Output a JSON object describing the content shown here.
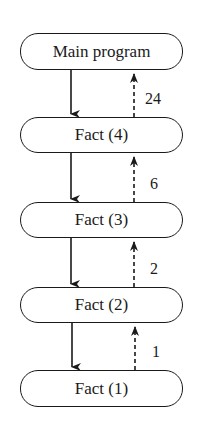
{
  "diagram": {
    "type": "recursion-call-stack",
    "nodes": [
      {
        "id": "main",
        "label": "Main program"
      },
      {
        "id": "fact4",
        "label": "Fact (4)"
      },
      {
        "id": "fact3",
        "label": "Fact (3)"
      },
      {
        "id": "fact2",
        "label": "Fact (2)"
      },
      {
        "id": "fact1",
        "label": "Fact (1)"
      }
    ],
    "return_values": [
      "24",
      "6",
      "2",
      "1"
    ],
    "edges": [
      {
        "from": "main",
        "to": "fact4",
        "style": "solid",
        "direction": "down"
      },
      {
        "from": "fact4",
        "to": "main",
        "style": "dashed",
        "direction": "up",
        "label": "24"
      },
      {
        "from": "fact4",
        "to": "fact3",
        "style": "solid",
        "direction": "down"
      },
      {
        "from": "fact3",
        "to": "fact4",
        "style": "dashed",
        "direction": "up",
        "label": "6"
      },
      {
        "from": "fact3",
        "to": "fact2",
        "style": "solid",
        "direction": "down"
      },
      {
        "from": "fact2",
        "to": "fact3",
        "style": "dashed",
        "direction": "up",
        "label": "2"
      },
      {
        "from": "fact2",
        "to": "fact1",
        "style": "solid",
        "direction": "down"
      },
      {
        "from": "fact1",
        "to": "fact2",
        "style": "dashed",
        "direction": "up",
        "label": "1"
      }
    ],
    "colors": {
      "stroke": "#1a1a1a",
      "background": "#ffffff"
    }
  }
}
